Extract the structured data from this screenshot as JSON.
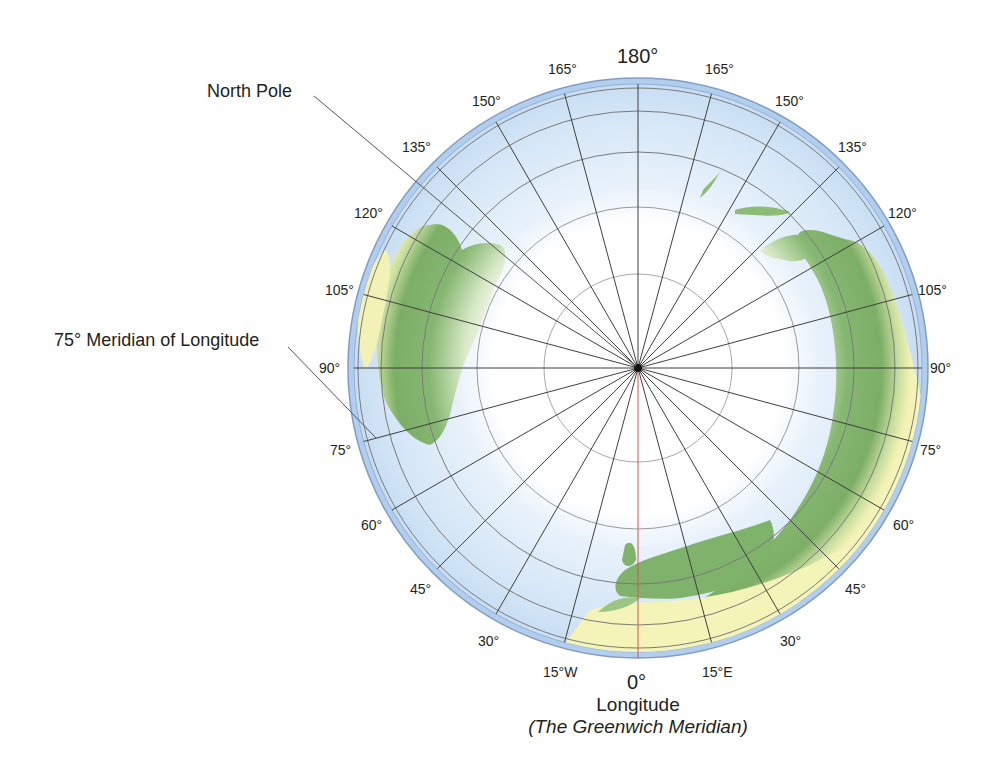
{
  "figure": {
    "title_top": "180°",
    "callouts": {
      "north_pole": "North Pole",
      "meridian_75": "75° Meridian of Longitude"
    },
    "bottom": {
      "zero": "0°",
      "longitude": "Longitude",
      "greenwich": "(The Greenwich Meridian)"
    },
    "labels_west": [
      "15°W",
      "30°",
      "45°",
      "60°",
      "75°",
      "90°",
      "105°",
      "120°",
      "135°",
      "150°",
      "165°"
    ],
    "labels_east": [
      "15°E",
      "30°",
      "45°",
      "60°",
      "75°",
      "90°",
      "105°",
      "120°",
      "135°",
      "150°",
      "165°"
    ],
    "colors": {
      "ocean": "#cfe3f5",
      "ocean_rim": "#a9c8ea",
      "land_green": "#7fb26a",
      "land_yellow": "#f4f3b8",
      "ice": "#ffffff",
      "meridian": "#3c3c3c",
      "greenwich": "#d9534f",
      "parallel": "#6c6c6c"
    },
    "projection": {
      "type": "polar azimuthal (north pole centered)",
      "meridian_spacing_deg": 15
    }
  }
}
